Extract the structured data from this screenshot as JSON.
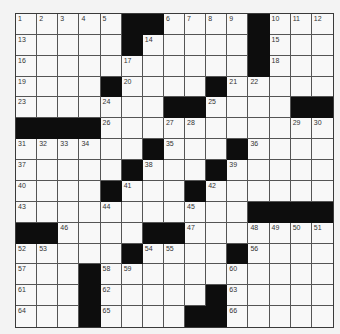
{
  "puzzle": {
    "rows": 15,
    "cols": 15,
    "layout": [
      ".....##....#...",
      ".....#.....#...",
      "...........#...",
      "....#....#.....",
      ".......##....##",
      "####...........",
      "......#...#....",
      ".....#...#.....",
      "....#...#......",
      "...........####",
      "##....##.......",
      ".....#....#....",
      "...#...........",
      "...#.....#.....",
      "...#....##....."
    ],
    "numbers": [
      [
        1,
        2,
        3,
        4,
        5,
        null,
        null,
        6,
        7,
        8,
        9,
        null,
        10,
        11,
        12
      ],
      [
        13,
        null,
        null,
        null,
        null,
        null,
        14,
        null,
        null,
        null,
        null,
        null,
        15,
        null,
        null
      ],
      [
        16,
        null,
        null,
        null,
        null,
        17,
        null,
        null,
        null,
        null,
        null,
        null,
        18,
        null,
        null
      ],
      [
        19,
        null,
        null,
        null,
        null,
        20,
        null,
        null,
        null,
        null,
        21,
        22,
        null,
        null,
        null
      ],
      [
        23,
        null,
        null,
        null,
        24,
        null,
        null,
        null,
        null,
        25,
        null,
        null,
        null,
        null,
        null
      ],
      [
        null,
        null,
        null,
        null,
        26,
        null,
        null,
        27,
        28,
        null,
        null,
        null,
        null,
        29,
        30
      ],
      [
        31,
        32,
        33,
        34,
        null,
        null,
        null,
        35,
        null,
        null,
        null,
        36,
        null,
        null,
        null
      ],
      [
        37,
        null,
        null,
        null,
        null,
        null,
        38,
        null,
        null,
        null,
        39,
        null,
        null,
        null,
        null
      ],
      [
        40,
        null,
        null,
        null,
        null,
        41,
        null,
        null,
        null,
        42,
        null,
        null,
        null,
        null,
        null
      ],
      [
        43,
        null,
        null,
        null,
        44,
        null,
        null,
        null,
        45,
        null,
        null,
        null,
        null,
        null,
        null
      ],
      [
        null,
        null,
        46,
        null,
        null,
        null,
        null,
        null,
        47,
        null,
        null,
        48,
        49,
        50,
        51
      ],
      [
        52,
        53,
        null,
        null,
        null,
        null,
        54,
        55,
        null,
        null,
        null,
        56,
        null,
        null,
        null
      ],
      [
        57,
        null,
        null,
        null,
        58,
        59,
        null,
        null,
        null,
        null,
        60,
        null,
        null,
        null,
        null
      ],
      [
        61,
        null,
        null,
        null,
        62,
        null,
        null,
        null,
        null,
        null,
        63,
        null,
        null,
        null,
        null
      ],
      [
        64,
        null,
        null,
        null,
        65,
        null,
        null,
        null,
        null,
        null,
        66,
        null,
        null,
        null,
        null
      ]
    ],
    "colors": {
      "black_cell": "#0d0d0d",
      "white_cell": "#f8f8f8",
      "grid_line": "#555555",
      "background": "#f3f3f3"
    }
  }
}
